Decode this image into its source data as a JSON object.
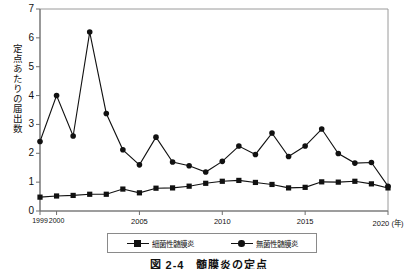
{
  "chart_data": {
    "type": "line",
    "title": "",
    "caption": "図 2-4　髄膜炎の定点",
    "xlabel": "(年)",
    "ylabel": "定点あたりの届出数",
    "ylim": [
      0,
      7
    ],
    "yticks": [
      0,
      1,
      2,
      3,
      4,
      5,
      6,
      7
    ],
    "xlim": [
      1999,
      2020
    ],
    "x": [
      1999,
      2000,
      2001,
      2002,
      2003,
      2004,
      2005,
      2006,
      2007,
      2008,
      2009,
      2010,
      2011,
      2012,
      2013,
      2014,
      2015,
      2016,
      2017,
      2018,
      2019,
      2020
    ],
    "xticks": [
      1999,
      2000,
      2005,
      2010,
      2015,
      2020
    ],
    "xtick_labels": [
      "1999",
      "2000",
      "2005",
      "2010",
      "2015",
      "2020 (年)"
    ],
    "grid": false,
    "legend_position": "bottom",
    "series": [
      {
        "name": "細菌性髄膜炎",
        "marker": "square",
        "color": "#111111",
        "values": [
          0.48,
          0.52,
          0.54,
          0.58,
          0.58,
          0.76,
          0.63,
          0.79,
          0.8,
          0.86,
          0.96,
          1.03,
          1.06,
          0.99,
          0.92,
          0.8,
          0.82,
          1.01,
          1.0,
          1.03,
          0.94,
          0.8
        ]
      },
      {
        "name": "無菌性髄膜炎",
        "marker": "circle",
        "color": "#111111",
        "values": [
          2.41,
          4.0,
          2.6,
          6.2,
          3.38,
          2.12,
          1.6,
          2.56,
          1.7,
          1.57,
          1.35,
          1.72,
          2.25,
          1.96,
          2.7,
          1.89,
          2.25,
          2.84,
          1.99,
          1.66,
          1.68,
          0.86
        ]
      }
    ]
  },
  "axis": {
    "y_title": "定点あたりの届出数"
  },
  "legend": {
    "items": [
      {
        "label": "細菌性髄膜炎",
        "marker": "square"
      },
      {
        "label": "無菌性髄膜炎",
        "marker": "circle"
      }
    ]
  },
  "figure": {
    "caption": "図 2-4　髄膜炎の定点"
  }
}
